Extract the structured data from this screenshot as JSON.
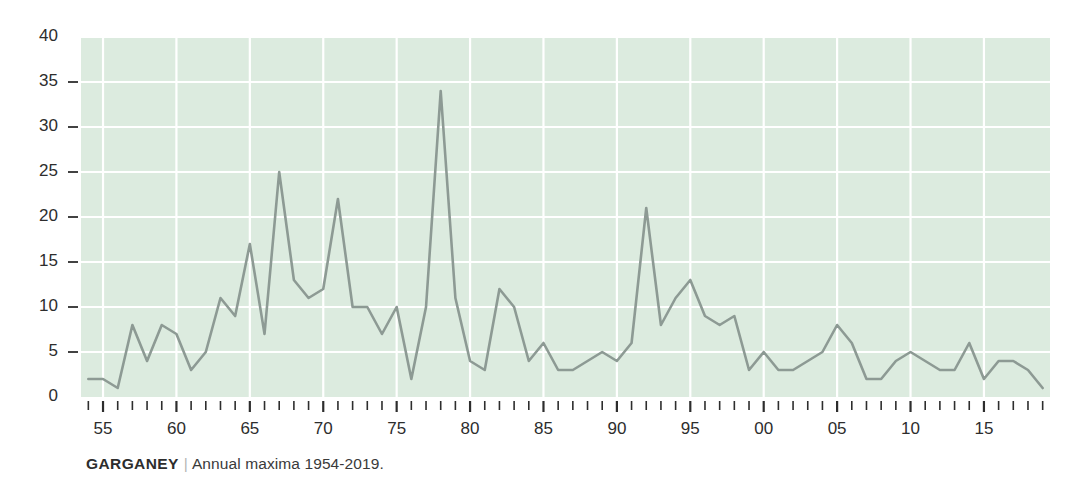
{
  "caption": {
    "species": "GARGANEY",
    "separator": "|",
    "subtitle": "Annual maxima 1954-2019."
  },
  "colors": {
    "plot_background": "#dcebdf",
    "gridline": "#ffffff",
    "line": "#8d9a94",
    "text": "#2d2d2d",
    "page_background": "#ffffff"
  },
  "chart_data": {
    "type": "line",
    "title": "GARGANEY",
    "subtitle": "Annual maxima 1954-2019.",
    "xlabel": "",
    "ylabel": "",
    "xlim": [
      1953.5,
      2019.5
    ],
    "ylim": [
      0,
      40
    ],
    "grid": true,
    "legend": null,
    "ytick_values": [
      0,
      5,
      10,
      15,
      20,
      25,
      30,
      35,
      40
    ],
    "ytick_labels": [
      "0",
      "5",
      "10",
      "15",
      "20",
      "25",
      "30",
      "35",
      "40"
    ],
    "xtick_major_years": [
      1955,
      1960,
      1965,
      1970,
      1975,
      1980,
      1985,
      1990,
      1995,
      2000,
      2005,
      2010,
      2015
    ],
    "xtick_major_labels": [
      "55",
      "60",
      "65",
      "70",
      "75",
      "80",
      "85",
      "90",
      "95",
      "00",
      "05",
      "10",
      "15"
    ],
    "x": [
      1954,
      1955,
      1956,
      1957,
      1958,
      1959,
      1960,
      1961,
      1962,
      1963,
      1964,
      1965,
      1966,
      1967,
      1968,
      1969,
      1970,
      1971,
      1972,
      1973,
      1974,
      1975,
      1976,
      1977,
      1978,
      1979,
      1980,
      1981,
      1982,
      1983,
      1984,
      1985,
      1986,
      1987,
      1988,
      1989,
      1990,
      1991,
      1992,
      1993,
      1994,
      1995,
      1996,
      1997,
      1998,
      1999,
      2000,
      2001,
      2002,
      2003,
      2004,
      2005,
      2006,
      2007,
      2008,
      2009,
      2010,
      2011,
      2012,
      2013,
      2014,
      2015,
      2016,
      2017,
      2018,
      2019
    ],
    "values": [
      2,
      2,
      1,
      8,
      4,
      8,
      7,
      3,
      5,
      11,
      9,
      17,
      7,
      25,
      13,
      11,
      12,
      22,
      10,
      10,
      7,
      10,
      2,
      10,
      34,
      11,
      4,
      3,
      12,
      10,
      4,
      6,
      3,
      3,
      4,
      5,
      4,
      6,
      21,
      8,
      11,
      13,
      9,
      8,
      9,
      3,
      5,
      3,
      3,
      4,
      5,
      8,
      6,
      2,
      2,
      4,
      5,
      4,
      3,
      3,
      6,
      2,
      4,
      4,
      3,
      1
    ],
    "series_name": "Garganey annual maxima"
  }
}
